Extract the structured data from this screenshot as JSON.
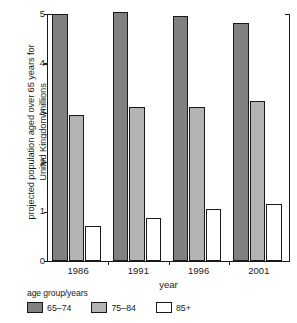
{
  "chart_data": {
    "type": "bar",
    "title": "",
    "subtitle": "",
    "xlabel": "year",
    "ylabel": "projected population aged over 65 years for\nUnited Kingdom/millions",
    "categories": [
      "1986",
      "1991",
      "1996",
      "2001"
    ],
    "series": [
      {
        "name": "65–74",
        "color": "#808080",
        "values": [
          5.0,
          5.05,
          4.96,
          4.82
        ]
      },
      {
        "name": "75–84",
        "color": "#b3b3b3",
        "values": [
          2.96,
          3.12,
          3.12,
          3.23
        ]
      },
      {
        "name": "85+",
        "color": "#ffffff",
        "values": [
          0.71,
          0.87,
          1.05,
          1.15
        ]
      }
    ],
    "ylim": [
      0,
      5
    ],
    "yticks": [
      0,
      1,
      2,
      3,
      4,
      5
    ],
    "ytick_labels": [
      "0",
      "1",
      "2",
      "3",
      "4",
      "5"
    ],
    "grid": false,
    "legend": {
      "title": "age group/years",
      "position": "below-plot",
      "entries": [
        "65–74",
        "75–84",
        "85+"
      ]
    },
    "axis_color": "#1a1a1a",
    "background": "#ffffff"
  }
}
